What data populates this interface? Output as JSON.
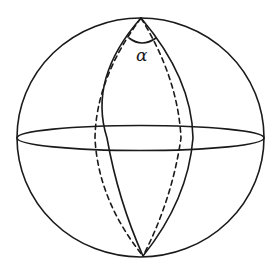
{
  "figure": {
    "angle_label": "α",
    "colors": {
      "stroke": "#1a1a1a",
      "background": "#ffffff"
    },
    "elements": [
      {
        "name": "outer-circle",
        "style": "solid"
      },
      {
        "name": "equator-ellipse",
        "style": "solid"
      },
      {
        "name": "meridian-left-front",
        "style": "solid"
      },
      {
        "name": "meridian-right-front",
        "style": "solid"
      },
      {
        "name": "meridian-left-back",
        "style": "dashed"
      },
      {
        "name": "meridian-right-back",
        "style": "dashed"
      },
      {
        "name": "angle-arc",
        "style": "solid"
      }
    ]
  }
}
